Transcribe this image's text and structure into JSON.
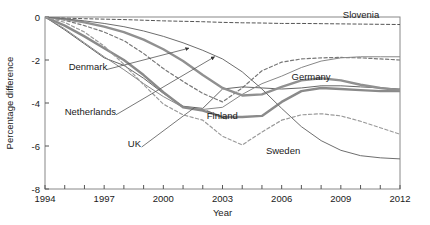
{
  "chart_data": {
    "type": "line",
    "title": "",
    "xlabel": "Year",
    "ylabel": "Percentage difference",
    "xlim": [
      1994,
      2012
    ],
    "ylim": [
      -8,
      0
    ],
    "xticks": [
      1994,
      1995,
      1996,
      1997,
      1998,
      1999,
      2000,
      2001,
      2002,
      2003,
      2004,
      2005,
      2006,
      2007,
      2008,
      2009,
      2010,
      2011,
      2012
    ],
    "xticklabels": [
      "1994",
      "",
      "",
      "1997",
      "",
      "",
      "2000",
      "",
      "",
      "2003",
      "",
      "",
      "2006",
      "",
      "",
      "2009",
      "",
      "",
      "2012"
    ],
    "yticks": [
      0,
      -2,
      -4,
      -6,
      -8
    ],
    "yticklabels": [
      "0",
      "-2",
      "-4",
      "-6",
      "-8"
    ],
    "grid": false,
    "legend": "in-plot annotations",
    "x": [
      1994,
      1995,
      1996,
      1997,
      1998,
      1999,
      2000,
      2001,
      2002,
      2003,
      2004,
      2005,
      2006,
      2007,
      2008,
      2009,
      2010,
      2011,
      2012
    ],
    "series": [
      {
        "name": "Slovenia",
        "style": "dashed",
        "color": "#555555",
        "width": 1.0,
        "label_x": 2009.1,
        "label_y": -0.05,
        "values": [
          0,
          -0.05,
          -0.08,
          -0.1,
          -0.12,
          -0.15,
          -0.18,
          -0.2,
          -0.22,
          -0.25,
          -0.27,
          -0.28,
          -0.3,
          -0.3,
          -0.31,
          -0.32,
          -0.33,
          -0.34,
          -0.35
        ]
      },
      {
        "name": "Netherlands",
        "style": "dashed",
        "color": "#777777",
        "width": 1.2,
        "label_x": 1995.0,
        "label_y": -4.55,
        "values": [
          0,
          -0.15,
          -0.4,
          -0.7,
          -1.1,
          -1.7,
          -2.4,
          -3.0,
          -3.55,
          -3.95,
          -3.3,
          -2.5,
          -2.1,
          -1.95,
          -1.9,
          -1.88,
          -1.9,
          -1.95,
          -2.0
        ]
      },
      {
        "name": "Denmark",
        "style": "solid",
        "color": "#666666",
        "width": 1.0,
        "label_x": 1995.2,
        "label_y": -2.45,
        "values": [
          0,
          -0.6,
          -1.25,
          -1.9,
          -2.25,
          -2.85,
          -3.55,
          -4.15,
          -4.25,
          -3.35,
          -3.25,
          -3.3,
          -3.35,
          -3.3,
          -3.2,
          -3.2,
          -3.25,
          -3.3,
          -3.35
        ]
      },
      {
        "name": "UK",
        "style": "solid",
        "color": "#888888",
        "width": 1.0,
        "label_x": 1998.2,
        "label_y": -6.05,
        "values": [
          0,
          -0.55,
          -1.2,
          -1.85,
          -2.45,
          -3.1,
          -3.7,
          -4.2,
          -4.3,
          -4.2,
          -3.6,
          -3.1,
          -2.75,
          -2.35,
          -2.05,
          -1.9,
          -1.85,
          -1.85,
          -1.85
        ]
      },
      {
        "name": "Finland",
        "style": "solid",
        "color": "#8a8a8a",
        "width": 2.4,
        "label_x": 2002.2,
        "label_y": -4.75,
        "values": [
          0,
          -0.4,
          -0.9,
          -1.45,
          -2.0,
          -2.7,
          -3.5,
          -4.2,
          -4.35,
          -4.65,
          -4.65,
          -4.6,
          -3.95,
          -3.45,
          -3.3,
          -3.35,
          -3.4,
          -3.45,
          -3.45
        ]
      },
      {
        "name": "Germany",
        "style": "solid",
        "color": "#909090",
        "width": 2.4,
        "label_x": 2006.5,
        "label_y": -2.95,
        "values": [
          0,
          -0.1,
          -0.25,
          -0.45,
          -0.7,
          -1.05,
          -1.5,
          -2.05,
          -2.7,
          -3.3,
          -3.65,
          -3.6,
          -3.25,
          -2.95,
          -2.85,
          -2.95,
          -3.15,
          -3.3,
          -3.4
        ]
      },
      {
        "name": "Sweden",
        "style": "solid",
        "color": "#6e6e6e",
        "width": 1.0,
        "label_x": 2005.2,
        "label_y": -6.35,
        "values": [
          0,
          -0.08,
          -0.18,
          -0.3,
          -0.45,
          -0.65,
          -0.9,
          -1.2,
          -1.55,
          -1.95,
          -2.55,
          -3.35,
          -4.25,
          -5.1,
          -5.75,
          -6.2,
          -6.45,
          -6.55,
          -6.6
        ]
      },
      {
        "name": "unlabelled-dashed",
        "style": "dashed",
        "color": "#9a9a9a",
        "width": 1.2,
        "label_x": null,
        "label_y": null,
        "values": [
          0,
          -0.25,
          -0.7,
          -1.35,
          -2.2,
          -3.15,
          -4.05,
          -4.55,
          -4.8,
          -5.55,
          -5.95,
          -5.35,
          -4.8,
          -4.55,
          -4.5,
          -4.6,
          -4.85,
          -5.15,
          -5.45
        ]
      }
    ],
    "annotations": [
      {
        "text": "Denmark",
        "arrow_to_x": 2001.3,
        "arrow_to_y": -1.45
      },
      {
        "text": "Netherlands",
        "arrow_to_x": 2002.6,
        "arrow_to_y": -1.85
      },
      {
        "text": "UK",
        "arrow_to_x": 2001.6,
        "arrow_to_y": -4.2
      },
      {
        "text": "Finland",
        "arrow_to_x": 2002.0,
        "arrow_to_y": -4.35
      },
      {
        "text": "Sweden",
        "arrow_to_x": null,
        "arrow_to_y": null
      },
      {
        "text": "Germany",
        "arrow_to_x": null,
        "arrow_to_y": null
      },
      {
        "text": "Slovenia",
        "arrow_to_x": null,
        "arrow_to_y": null
      }
    ]
  }
}
